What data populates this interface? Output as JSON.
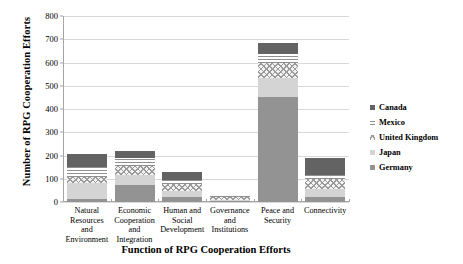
{
  "chart_data": {
    "type": "bar",
    "subtype": "stacked-vertical",
    "title": "",
    "xlabel": "Function of RPG Cooperation Efforts",
    "ylabel": "Number of RPG Cooperation Efforts",
    "ylim": [
      0,
      800
    ],
    "ytick_step": 100,
    "yticks": [
      "0",
      "100",
      "200",
      "300",
      "400",
      "500",
      "600",
      "700",
      "800"
    ],
    "grid": true,
    "legend_position": "right",
    "categories": [
      "Natural Resources and Environment",
      "Economic Cooperation and Integration",
      "Human and Social Development",
      "Governance and Institutions",
      "Peace and Security",
      "Connectivity"
    ],
    "category_lines": [
      [
        "Natural",
        "Resources and",
        "Environment"
      ],
      [
        "Economic",
        "Cooperation",
        "and",
        "Integration"
      ],
      [
        "Human and",
        "Social",
        "Development"
      ],
      [
        "Governance",
        "and",
        "Institutions"
      ],
      [
        "Peace and",
        "Security"
      ],
      [
        "Connectivity"
      ]
    ],
    "series": [
      {
        "name": "Germany",
        "key": "germany",
        "color": "#939393",
        "values": [
          14,
          72,
          22,
          4,
          450,
          20
        ]
      },
      {
        "name": "Japan",
        "key": "japan",
        "color": "#d4d4d4",
        "values": [
          66,
          45,
          25,
          6,
          85,
          34
        ]
      },
      {
        "name": "United Kingdom",
        "key": "uk",
        "color": "#f2f2f2",
        "values": [
          26,
          40,
          30,
          12,
          64,
          44
        ]
      },
      {
        "name": "Mexico",
        "key": "mexico",
        "color": "#ffffff",
        "values": [
          44,
          33,
          18,
          3,
          36,
          20
        ]
      },
      {
        "name": "Canada",
        "key": "canada",
        "color": "#636363",
        "values": [
          55,
          30,
          35,
          3,
          50,
          70
        ]
      }
    ],
    "series_order_bottom_to_top": [
      "Germany",
      "Japan",
      "United Kingdom",
      "Mexico",
      "Canada"
    ],
    "totals": [
      205,
      220,
      130,
      28,
      685,
      188
    ],
    "legend_entries": [
      "Canada",
      "Mexico",
      "United Kingdom",
      "Japan",
      "Germany"
    ]
  },
  "colors": {
    "gridline": "#d9d9d9",
    "axis": "#a6a6a6",
    "text": "#000000",
    "background": "#ffffff"
  }
}
